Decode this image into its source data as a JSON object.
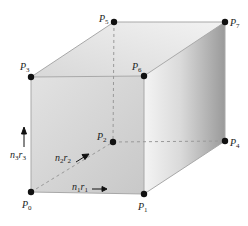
{
  "diagram": {
    "type": "cube",
    "colors": {
      "front_face_light": "#dcdcdc",
      "front_face_dark": "#c9c9c9",
      "top_face": "#e8e8e8",
      "right_face_light": "#eeeeee",
      "right_face_dark": "#9e9e9e",
      "edge": "#b0b0b0",
      "hidden_edge": "#9a9a9a",
      "vertex": "#111111",
      "label": "#222222"
    },
    "vertices": [
      {
        "id": "P0",
        "label": "P",
        "sub": "0",
        "x": 31,
        "y": 192
      },
      {
        "id": "P1",
        "label": "P",
        "sub": "1",
        "x": 144,
        "y": 194
      },
      {
        "id": "P2",
        "label": "P",
        "sub": "2",
        "x": 113,
        "y": 142
      },
      {
        "id": "P3",
        "label": "P",
        "sub": "3",
        "x": 31,
        "y": 77
      },
      {
        "id": "P4",
        "label": "P",
        "sub": "4",
        "x": 225,
        "y": 141
      },
      {
        "id": "P5",
        "label": "P",
        "sub": "5",
        "x": 114,
        "y": 22
      },
      {
        "id": "P6",
        "label": "P",
        "sub": "6",
        "x": 144,
        "y": 76
      },
      {
        "id": "P7",
        "label": "P",
        "sub": "7",
        "x": 225,
        "y": 22
      }
    ],
    "vectors": [
      {
        "id": "n1r1",
        "n": "n",
        "n_sub": "1",
        "r": "r",
        "r_sub": "1",
        "direction": "right"
      },
      {
        "id": "n2r2",
        "n": "n",
        "n_sub": "2",
        "r": "r",
        "r_sub": "2",
        "direction": "diagonal-back"
      },
      {
        "id": "n3r3",
        "n": "n",
        "n_sub": "3",
        "r": "r",
        "r_sub": "3",
        "direction": "up"
      }
    ]
  }
}
